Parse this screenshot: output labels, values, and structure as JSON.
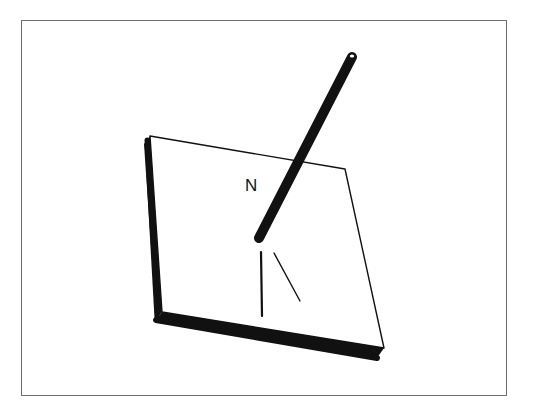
{
  "diagram": {
    "type": "surface-normal-illustration",
    "labels": {
      "normal": "N"
    },
    "elements": {
      "plane": "tilted flat plate with thick dark left and bottom edges",
      "normal_vector": "thick rod rising from point on plate, labeled N",
      "projection_lines": "two thin lines below the rod's base on the plate surface"
    },
    "colors": {
      "ink": "#111111",
      "background": "#ffffff",
      "frame": "#6e6e6e"
    }
  }
}
